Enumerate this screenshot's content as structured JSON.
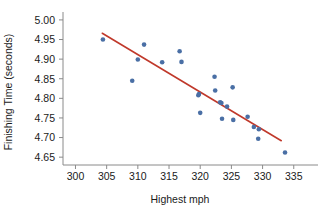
{
  "chart_data": {
    "type": "scatter",
    "title": "",
    "xlabel": "Highest mph",
    "ylabel": "Finishing Time (seconds)",
    "xlim": [
      298,
      336
    ],
    "ylim": [
      4.63,
      5.01
    ],
    "xticks": [
      300,
      305,
      310,
      315,
      320,
      325,
      330,
      335
    ],
    "xtick_labels": [
      "300",
      "305",
      "310",
      "315",
      "320",
      "325",
      "330",
      "335"
    ],
    "yticks": [
      4.65,
      4.7,
      4.75,
      4.8,
      4.85,
      4.9,
      4.95,
      5.0
    ],
    "ytick_labels": [
      "4.65",
      "4.70",
      "4.75",
      "4.80",
      "4.85",
      "4.90",
      "4.95",
      "5.00"
    ],
    "grid": false,
    "legend": false,
    "point_color": "#4a6fa5",
    "line_color": "#c0392b",
    "x": [
      304.4,
      309.1,
      310.0,
      311.0,
      313.9,
      316.7,
      317.0,
      319.7,
      319.8,
      320.0,
      322.3,
      322.4,
      323.2,
      323.4,
      323.5,
      324.3,
      325.2,
      325.3,
      327.6,
      328.6,
      329.3,
      329.4,
      333.6
    ],
    "y": [
      4.95,
      4.845,
      4.899,
      4.937,
      4.892,
      4.92,
      4.893,
      4.808,
      4.811,
      4.763,
      4.855,
      4.82,
      4.79,
      4.788,
      4.748,
      4.779,
      4.828,
      4.745,
      4.753,
      4.727,
      4.697,
      4.721,
      4.662
    ],
    "series": [
      {
        "name": "Observations",
        "type": "scatter",
        "points": [
          {
            "x": 304.4,
            "y": 4.95
          },
          {
            "x": 309.1,
            "y": 4.845
          },
          {
            "x": 310.0,
            "y": 4.899
          },
          {
            "x": 311.0,
            "y": 4.937
          },
          {
            "x": 313.9,
            "y": 4.892
          },
          {
            "x": 316.7,
            "y": 4.92
          },
          {
            "x": 317.0,
            "y": 4.893
          },
          {
            "x": 319.7,
            "y": 4.808
          },
          {
            "x": 319.8,
            "y": 4.811
          },
          {
            "x": 320.0,
            "y": 4.763
          },
          {
            "x": 322.3,
            "y": 4.855
          },
          {
            "x": 322.4,
            "y": 4.82
          },
          {
            "x": 323.2,
            "y": 4.79
          },
          {
            "x": 323.4,
            "y": 4.788
          },
          {
            "x": 323.5,
            "y": 4.748
          },
          {
            "x": 324.3,
            "y": 4.779
          },
          {
            "x": 325.2,
            "y": 4.828
          },
          {
            "x": 325.3,
            "y": 4.745
          },
          {
            "x": 327.6,
            "y": 4.753
          },
          {
            "x": 328.6,
            "y": 4.727
          },
          {
            "x": 329.3,
            "y": 4.697
          },
          {
            "x": 329.4,
            "y": 4.721
          },
          {
            "x": 333.6,
            "y": 4.662
          }
        ]
      },
      {
        "name": "Least-squares regression line",
        "type": "line",
        "endpoints": [
          {
            "x": 304.3,
            "y": 4.966
          },
          {
            "x": 333.0,
            "y": 4.692
          }
        ]
      }
    ]
  }
}
